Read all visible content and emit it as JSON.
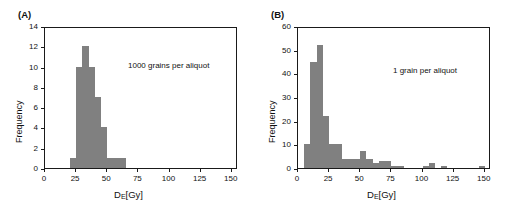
{
  "figure": {
    "panels": [
      {
        "label": "(A)",
        "annotation": "1000 grains per aliquot",
        "xlabel_main": "D",
        "xlabel_sub": "E",
        "xlabel_unit": "[Gy]",
        "ylabel": "Frequency"
      },
      {
        "label": "(B)",
        "annotation": "1 grain per aliquot",
        "xlabel_main": "D",
        "xlabel_sub": "E",
        "xlabel_unit": "[Gy]",
        "ylabel": "Frequency"
      }
    ],
    "bar_color": "#808080",
    "axis_color": "#1a1a1a"
  },
  "chart_data": [
    {
      "type": "bar",
      "title": "(A)",
      "subtitle": "1000 grains per aliquot",
      "xlabel": "D_E [Gy]",
      "ylabel": "Frequency",
      "xlim": [
        0,
        155
      ],
      "ylim": [
        0,
        14
      ],
      "xticks": [
        0,
        25,
        50,
        75,
        100,
        125,
        150
      ],
      "yticks": [
        0,
        2,
        4,
        6,
        8,
        10,
        12,
        14
      ],
      "grid": false,
      "legend": "none",
      "bin_width": 5,
      "bin_starts": [
        20,
        25,
        30,
        35,
        40,
        45,
        50,
        55,
        60
      ],
      "values": [
        1,
        10,
        12,
        10,
        7,
        4,
        1,
        1,
        1
      ],
      "categories": [
        "20-25",
        "25-30",
        "30-35",
        "35-40",
        "40-45",
        "45-50",
        "50-55",
        "55-60",
        "60-65"
      ]
    },
    {
      "type": "bar",
      "title": "(B)",
      "subtitle": "1 grain per aliquot",
      "xlabel": "D_E [Gy]",
      "ylabel": "Frequency",
      "xlim": [
        0,
        155
      ],
      "ylim": [
        0,
        60
      ],
      "xticks": [
        0,
        25,
        50,
        75,
        100,
        125,
        150
      ],
      "yticks": [
        0,
        10,
        20,
        30,
        40,
        50,
        60
      ],
      "grid": false,
      "legend": "none",
      "bin_width": 5,
      "bin_starts": [
        5,
        10,
        15,
        20,
        25,
        30,
        35,
        40,
        45,
        50,
        55,
        60,
        65,
        70,
        75,
        80,
        85,
        90,
        95,
        100,
        105,
        110,
        115,
        120,
        125,
        130,
        135,
        140,
        145
      ],
      "values": [
        10,
        45,
        52,
        22,
        10,
        10,
        4,
        4,
        4,
        7,
        4,
        2,
        3,
        3,
        1,
        1,
        0,
        0,
        0,
        1,
        2,
        0,
        1,
        0,
        0,
        0,
        0,
        0,
        1
      ],
      "categories": [
        "5-10",
        "10-15",
        "15-20",
        "20-25",
        "25-30",
        "30-35",
        "35-40",
        "40-45",
        "45-50",
        "50-55",
        "55-60",
        "60-65",
        "65-70",
        "70-75",
        "75-80",
        "80-85",
        "85-90",
        "90-95",
        "95-100",
        "100-105",
        "105-110",
        "110-115",
        "115-120",
        "120-125",
        "125-130",
        "130-135",
        "135-140",
        "140-145",
        "145-150"
      ]
    }
  ]
}
